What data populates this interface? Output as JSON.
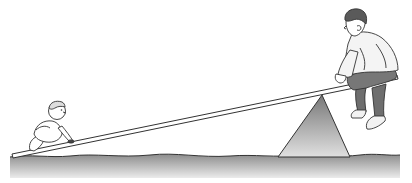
{
  "scene": {
    "description": "Seesaw illustration: a baby crawling on the low end of a plank and a man sitting on the high end",
    "colors": {
      "ground_top": "#8a8a8a",
      "ground_bottom": "#e6e6e6",
      "fulcrum_top": "#7a7a7a",
      "fulcrum_bottom": "#dcdcdc",
      "outline": "#333333",
      "shirt": "#f4f4f4",
      "pants": "#6e6e6e",
      "hair": "#5a5a5a",
      "skin": "#ffffff"
    }
  }
}
